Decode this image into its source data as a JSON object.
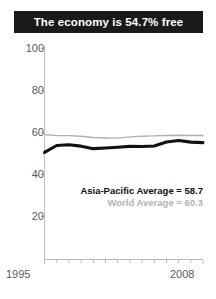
{
  "title": "The economy is 54.7% free",
  "legend": {
    "asia_pacific": "Asia-Pacific Average = 58.7",
    "world": "World Average = 60.3"
  },
  "axis": {
    "y_ticks": [
      "100",
      "80",
      "60",
      "40",
      "20"
    ],
    "x_start": "1995",
    "x_end": "2008"
  },
  "chart_data": {
    "type": "line",
    "title": "The economy is 54.7% free",
    "xlabel": "",
    "ylabel": "",
    "xlim": [
      1995,
      2008
    ],
    "ylim": [
      0,
      100
    ],
    "yticks": [
      20,
      40,
      60,
      80,
      100
    ],
    "xticks": [
      1995,
      1996,
      1997,
      1998,
      1999,
      2000,
      2001,
      2002,
      2003,
      2004,
      2005,
      2006,
      2007,
      2008
    ],
    "grid": false,
    "legend_position": "inside-lower-right",
    "x": [
      1995,
      1996,
      1997,
      1998,
      1999,
      2000,
      2001,
      2002,
      2003,
      2004,
      2005,
      2006,
      2007,
      2008
    ],
    "series": [
      {
        "name": "Asia-Pacific Average",
        "color": "#111111",
        "average": 58.7,
        "values": [
          50.5,
          53.8,
          54.2,
          53.5,
          52.3,
          52.6,
          53.0,
          53.4,
          53.3,
          53.6,
          55.5,
          56.2,
          55.4,
          55.2
        ]
      },
      {
        "name": "World Average",
        "color": "#b0b0b0",
        "average": 60.3,
        "values": [
          59.0,
          58.6,
          58.5,
          58.2,
          57.6,
          57.4,
          57.3,
          57.9,
          58.2,
          58.4,
          58.6,
          58.7,
          58.6,
          58.6
        ]
      }
    ],
    "annotations": [
      "Asia-Pacific Average = 58.7",
      "World Average = 60.3"
    ]
  }
}
